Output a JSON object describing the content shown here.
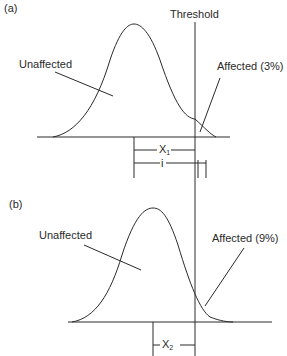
{
  "panel_a": {
    "tag": "(a)",
    "threshold_label": "Threshold",
    "unaffected_label": "Unaffected",
    "affected_label": "Affected (3%)",
    "x_label": "X",
    "x_sub": "1",
    "i_label": "i"
  },
  "panel_b": {
    "tag": "(b)",
    "unaffected_label": "Unaffected",
    "affected_label": "Affected (9%)",
    "x_label": "X",
    "x_sub": "2"
  },
  "colors": {
    "stroke": "#2a2a2a",
    "background": "#ffffff"
  }
}
